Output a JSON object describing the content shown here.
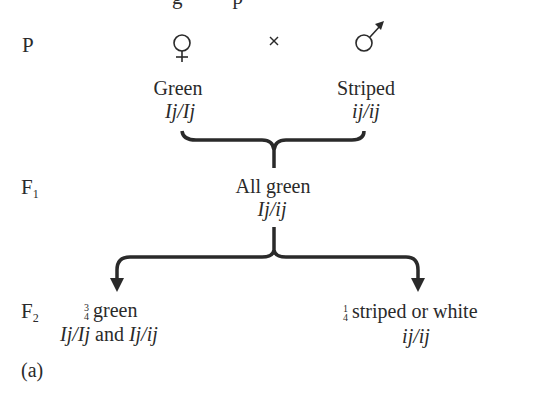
{
  "cut_off_top_text": "g  p",
  "generations": {
    "P": {
      "label": "P",
      "sub": ""
    },
    "F1": {
      "label": "F",
      "sub": "1"
    },
    "F2": {
      "label": "F",
      "sub": "2"
    }
  },
  "parents": {
    "female": {
      "symbol": "♀",
      "phenotype": "Green",
      "genotype": "Ij/Ij"
    },
    "cross_symbol": "×",
    "male": {
      "symbol": "♂",
      "phenotype": "Striped",
      "genotype": "ij/ij"
    }
  },
  "f1": {
    "phenotype": "All green",
    "genotype": "Ij/ij"
  },
  "f2": {
    "left": {
      "fraction_num": "3",
      "fraction_den": "4",
      "phenotype": "green",
      "genotype": "Ij/Ij and Ij/ij"
    },
    "right": {
      "fraction_num": "1",
      "fraction_den": "4",
      "phenotype": "striped or white",
      "genotype": "ij/ij"
    }
  },
  "panel_label": "(a)",
  "colors": {
    "ink": "#2a2a2a",
    "background": "#ffffff"
  }
}
